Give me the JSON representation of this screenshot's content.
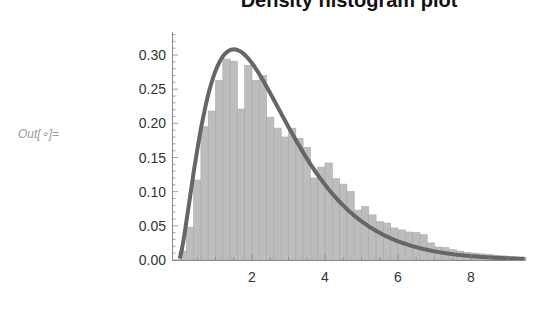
{
  "cell": {
    "output_label": "Out[∘]="
  },
  "chart_data": {
    "type": "bar",
    "title": "Density histogram plot",
    "title_note": "title is clipped at top edge of screenshot",
    "xlabel": "",
    "ylabel": "",
    "xlim": [
      0,
      9.5
    ],
    "ylim": [
      0,
      0.33
    ],
    "x_ticks": [
      2,
      4,
      6,
      8
    ],
    "y_ticks": [
      "0.00",
      "0.05",
      "0.10",
      "0.15",
      "0.20",
      "0.25",
      "0.30"
    ],
    "bin_width": 0.2,
    "bins_start": [
      0.0,
      0.2,
      0.4,
      0.6,
      0.8,
      1.0,
      1.2,
      1.4,
      1.6,
      1.8,
      2.0,
      2.2,
      2.4,
      2.6,
      2.8,
      3.0,
      3.2,
      3.4,
      3.6,
      3.8,
      4.0,
      4.2,
      4.4,
      4.6,
      4.8,
      5.0,
      5.2,
      5.4,
      5.6,
      5.8,
      6.0,
      6.2,
      6.4,
      6.6,
      6.8,
      7.0,
      7.2,
      7.4,
      7.6,
      7.8,
      8.0,
      8.2,
      8.4,
      8.6,
      8.8,
      9.0,
      9.2
    ],
    "values": [
      0.013,
      0.048,
      0.117,
      0.195,
      0.218,
      0.263,
      0.294,
      0.291,
      0.221,
      0.285,
      0.263,
      0.27,
      0.209,
      0.193,
      0.18,
      0.193,
      0.178,
      0.165,
      0.12,
      0.136,
      0.142,
      0.119,
      0.111,
      0.1,
      0.073,
      0.078,
      0.066,
      0.056,
      0.054,
      0.047,
      0.044,
      0.041,
      0.04,
      0.037,
      0.025,
      0.019,
      0.018,
      0.015,
      0.013,
      0.011,
      0.01,
      0.009,
      0.008,
      0.007,
      0.006,
      0.005,
      0.004
    ],
    "series": [
      {
        "name": "histogram",
        "kind": "bar",
        "color": "#bdbdbd"
      },
      {
        "name": "fitted PDF (Gamma, shape≈2.5, scale≈1)",
        "kind": "line",
        "color": "#666666",
        "peak": {
          "x": 1.5,
          "y": 0.308
        }
      }
    ],
    "grid": false,
    "legend": "none"
  },
  "colors": {
    "bar_fill": "#bdbdbd",
    "bar_edge": "#a8a8a8",
    "curve": "#666666",
    "axis": "#888888"
  }
}
